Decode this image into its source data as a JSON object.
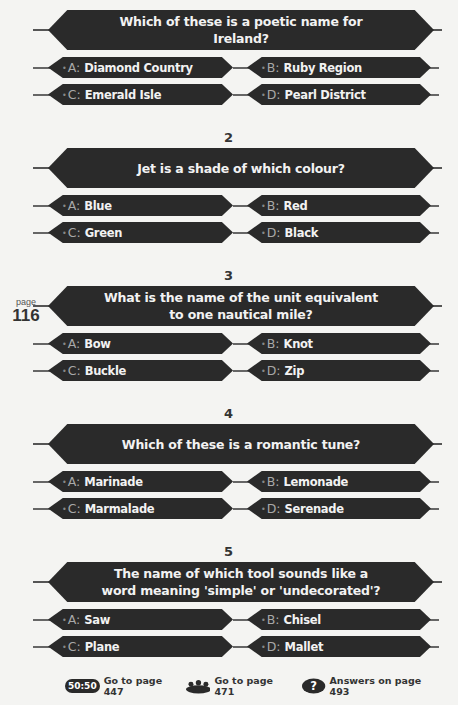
{
  "page_marker": {
    "label": "page",
    "number": "116"
  },
  "questions": [
    {
      "number": "",
      "text": "Which of these is a poetic name for Ireland?",
      "answers": [
        {
          "letter": "A:",
          "text": "Diamond Country"
        },
        {
          "letter": "B:",
          "text": "Ruby Region"
        },
        {
          "letter": "C:",
          "text": "Emerald Isle"
        },
        {
          "letter": "D:",
          "text": "Pearl District"
        }
      ]
    },
    {
      "number": "2",
      "text": "Jet is a shade of which colour?",
      "answers": [
        {
          "letter": "A:",
          "text": "Blue"
        },
        {
          "letter": "B:",
          "text": "Red"
        },
        {
          "letter": "C:",
          "text": "Green"
        },
        {
          "letter": "D:",
          "text": "Black"
        }
      ]
    },
    {
      "number": "3",
      "text": "What is the name of the unit equivalent to one nautical mile?",
      "answers": [
        {
          "letter": "A:",
          "text": "Bow"
        },
        {
          "letter": "B:",
          "text": "Knot"
        },
        {
          "letter": "C:",
          "text": "Buckle"
        },
        {
          "letter": "D:",
          "text": "Zip"
        }
      ]
    },
    {
      "number": "4",
      "text": "Which of these is a romantic tune?",
      "answers": [
        {
          "letter": "A:",
          "text": "Marinade"
        },
        {
          "letter": "B:",
          "text": "Lemonade"
        },
        {
          "letter": "C:",
          "text": "Marmalade"
        },
        {
          "letter": "D:",
          "text": "Serenade"
        }
      ]
    },
    {
      "number": "5",
      "text": "The name of which tool sounds like a word meaning 'simple' or 'undecorated'?",
      "answers": [
        {
          "letter": "A:",
          "text": "Saw"
        },
        {
          "letter": "B:",
          "text": "Chisel"
        },
        {
          "letter": "C:",
          "text": "Plane"
        },
        {
          "letter": "D:",
          "text": "Mallet"
        }
      ]
    }
  ],
  "footer": {
    "fifty_fifty": {
      "icon": "50:50",
      "text": "Go to page 447"
    },
    "ask_audience": {
      "icon": "audience-icon",
      "text": "Go to page 471"
    },
    "answers": {
      "icon": "question-mark-icon",
      "text": "Answers on page 493"
    }
  }
}
